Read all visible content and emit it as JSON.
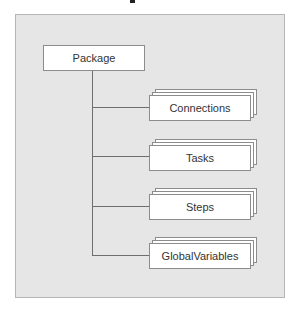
{
  "diagram": {
    "root": {
      "label": "Package"
    },
    "children": [
      {
        "label": "Connections",
        "stacked": true
      },
      {
        "label": "Tasks",
        "stacked": true
      },
      {
        "label": "Steps",
        "stacked": true
      },
      {
        "label": "GlobalVariables",
        "stacked": true
      }
    ],
    "colors": {
      "panel_background": "#e6e6e6",
      "panel_border": "#b5b5b5",
      "box_fill": "#ffffff",
      "box_border": "#8c8c8c",
      "connector": "#6e6e6e",
      "text": "#333333"
    }
  }
}
